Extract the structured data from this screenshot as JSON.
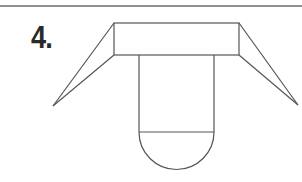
{
  "figure": {
    "number_label": "4.",
    "stroke_color": "#555555",
    "rule_color": "#6a6a6a",
    "shapes": {
      "top_rule": {
        "x1": 0,
        "y1": 6,
        "x2": 302,
        "y2": 6
      },
      "box": {
        "x": 114,
        "y": 23,
        "width": 125,
        "height": 32
      },
      "left_wing_tip": {
        "x": 53,
        "y": 106
      },
      "right_wing_tip": {
        "x": 298,
        "y": 105
      },
      "stem": {
        "x_left": 139,
        "x_right": 214,
        "y_top": 55,
        "y_divider": 132
      },
      "semicircle": {
        "cx": 176.5,
        "cy": 132,
        "r": 37.5
      }
    }
  }
}
